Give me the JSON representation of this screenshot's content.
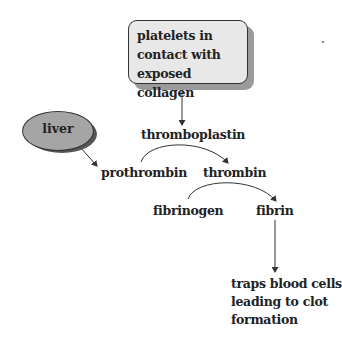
{
  "diagram": {
    "type": "flow",
    "title": "",
    "nodes": {
      "start": {
        "label_lines": [
          "platelets in",
          "contact with",
          "exposed collagen"
        ],
        "shape": "rounded-box",
        "fill": "#e8e8e8"
      },
      "liver": {
        "label": "liver",
        "shape": "ellipse",
        "fill": "#a5a5a5"
      },
      "thromboplastin": {
        "label": "thromboplastin"
      },
      "prothrombin": {
        "label": "prothrombin"
      },
      "thrombin": {
        "label": "thrombin"
      },
      "fibrinogen": {
        "label": "fibrinogen"
      },
      "fibrin": {
        "label": "fibrin"
      },
      "outcome": {
        "label_lines": [
          "traps blood cells",
          "leading to clot",
          "formation"
        ]
      }
    },
    "edges": [
      {
        "from": "platelets in contact with exposed collagen",
        "to": "thromboplastin",
        "style": "straight"
      },
      {
        "from": "liver",
        "to": "prothrombin",
        "style": "straight"
      },
      {
        "from": "prothrombin",
        "to": "thrombin",
        "style": "curved",
        "catalyst": "thromboplastin"
      },
      {
        "from": "fibrinogen",
        "to": "fibrin",
        "style": "curved",
        "catalyst": "thrombin"
      },
      {
        "from": "fibrin",
        "to": "traps blood cells leading to clot formation",
        "style": "straight"
      }
    ],
    "colors": {
      "line": "#333333",
      "box_fill": "#e8e8e8",
      "box_shadow": "#9a9a9a",
      "ellipse_fill": "#a5a5a5",
      "ellipse_shadow": "#555555"
    }
  }
}
